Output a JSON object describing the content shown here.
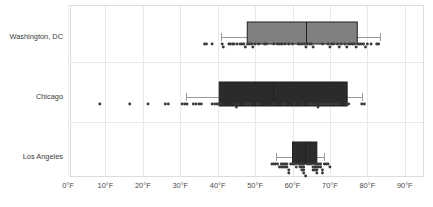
{
  "chart_data": {
    "type": "box",
    "title": "",
    "xlabel": "",
    "ylabel": "",
    "xlim": [
      -5,
      95
    ],
    "xticks": [
      0,
      10,
      20,
      30,
      40,
      50,
      60,
      70,
      80,
      90
    ],
    "xtick_labels": [
      "0°F",
      "10°F",
      "20°F",
      "30°F",
      "40°F",
      "50°F",
      "60°F",
      "70°F",
      "80°F",
      "90°F"
    ],
    "categories": [
      "Washington, DC",
      "Chicago",
      "Los Angeles"
    ],
    "grid": true,
    "grid_axis": "both",
    "legend": "none",
    "orientation": "horizontal",
    "series": [
      {
        "name": "Washington, DC",
        "box_color": "#808080",
        "whisker_min": 41.0,
        "q1": 47.9,
        "median": 63.6,
        "q3": 77.3,
        "whisker_max": 83.4,
        "points": [
          36.5,
          37.0,
          38.5,
          41.2,
          41.5,
          43.0,
          43.4,
          44.0,
          44.4,
          45.2,
          46.0,
          46.5,
          47.0,
          47.4,
          48.0,
          48.4,
          49.0,
          49.4,
          50.0,
          51.0,
          52.5,
          53.0,
          55.0,
          56.0,
          56.6,
          57.2,
          58.0,
          59.0,
          60.0,
          61.5,
          62.0,
          62.6,
          63.2,
          63.6,
          64.0,
          64.6,
          65.0,
          65.5,
          68.0,
          69.5,
          70.0,
          70.5,
          71.0,
          72.0,
          72.5,
          73.0,
          74.0,
          74.5,
          75.0,
          75.5,
          76.0,
          76.5,
          77.0,
          77.5,
          78.0,
          78.5,
          79.0,
          79.5,
          80.0,
          81.0,
          82.5,
          83.0
        ]
      },
      {
        "name": "Chicago",
        "box_color": "#2b2b2b",
        "whisker_min": 31.5,
        "q1": 40.4,
        "median": 54.8,
        "q3": 74.6,
        "whisker_max": 78.6,
        "points": [
          8.5,
          16.5,
          21.4,
          26.0,
          26.8,
          30.5,
          31.2,
          31.8,
          33.5,
          34.2,
          35.0,
          35.6,
          38.5,
          39.2,
          39.8,
          40.4,
          41.0,
          44.5,
          45.0,
          45.4,
          47.5,
          48.2,
          48.8,
          50.5,
          51.0,
          55.0,
          57.5,
          58.2,
          60.5,
          62.5,
          64.5,
          65.0,
          65.6,
          66.2,
          66.8,
          67.4,
          68.0,
          68.6,
          69.2,
          69.8,
          70.4,
          71.0,
          71.6,
          72.2,
          74.5,
          75.0,
          78.5,
          79.2
        ]
      },
      {
        "name": "Los Angeles",
        "box_color": "#2b2b2b",
        "whisker_min": 55.5,
        "q1": 60.0,
        "median": 63.4,
        "q3": 66.5,
        "whisker_max": 68.5,
        "points": [
          54.5,
          55.0,
          55.5,
          56.0,
          56.5,
          57.0,
          57.5,
          58.0,
          58.5,
          59.0,
          59.5,
          60.0,
          60.5,
          61.0,
          61.5,
          62.0,
          62.5,
          63.0,
          63.5,
          64.0,
          64.5,
          65.0,
          65.5,
          66.0,
          66.5,
          67.0,
          67.5,
          68.0,
          68.5,
          69.0,
          69.5,
          70.0,
          57.0,
          57.5,
          58.0,
          58.5,
          59.0,
          62.0,
          62.5,
          63.0,
          65.5,
          66.0,
          66.5,
          67.0,
          67.5,
          68.0,
          62.5,
          63.0,
          66.0,
          66.5,
          63.0,
          66.5
        ]
      }
    ]
  },
  "axis": {
    "tick_0": "0°F",
    "tick_1": "10°F",
    "tick_2": "20°F",
    "tick_3": "30°F",
    "tick_4": "40°F",
    "tick_5": "50°F",
    "tick_6": "60°F",
    "tick_7": "70°F",
    "tick_8": "80°F",
    "tick_9": "90°F"
  },
  "labels": {
    "cat_0": "Washington, DC",
    "cat_1": "Chicago",
    "cat_2": "Los Angeles"
  },
  "colors": {
    "grid": "#e9e9ec",
    "frame": "#dddde1",
    "dot": "#3a3a3a",
    "dc_box": "#808080",
    "chi_box": "#2b2b2b",
    "la_box": "#2b2b2b",
    "box_outline": "#1f1f1f",
    "whisker": "#9a9a9a",
    "text": "#3b3b3b"
  }
}
